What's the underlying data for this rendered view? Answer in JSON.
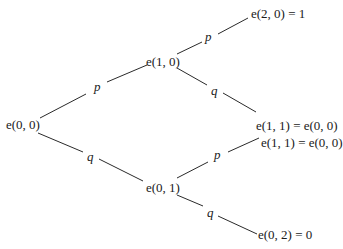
{
  "diagram": {
    "type": "probability-tree",
    "nodes": {
      "root": {
        "label": "e(0, 0)"
      },
      "up": {
        "label": "e(1, 0)"
      },
      "down": {
        "label": "e(0, 1)"
      },
      "up_up": {
        "label": "e(2, 0) = 1"
      },
      "up_down": {
        "label": "e(1, 1) = e(0, 0)"
      },
      "down_up": {
        "label": "e(1, 1) = e(0, 0)"
      },
      "down_down": {
        "label": "e(0, 2) = 0"
      }
    },
    "edges": {
      "root_up": {
        "label": "p"
      },
      "root_down": {
        "label": "q"
      },
      "up_up": {
        "label": "p"
      },
      "up_down": {
        "label": "q"
      },
      "down_up": {
        "label": "p"
      },
      "down_down": {
        "label": "q"
      }
    }
  }
}
